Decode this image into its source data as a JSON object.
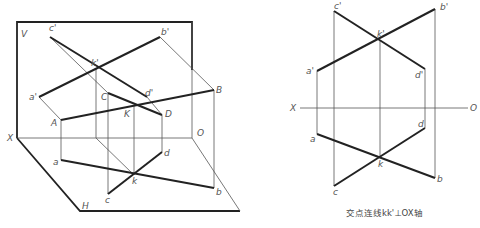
{
  "left_diagram": {
    "plane_labels": {
      "v": "V",
      "h": "H",
      "x": "X",
      "o": "O"
    },
    "points_upper": {
      "A": "A",
      "B": "B",
      "C": "C",
      "D": "D",
      "K": "K"
    },
    "points_v": {
      "a": "a'",
      "b": "b'",
      "c": "c'",
      "d": "d'",
      "k": "k'"
    },
    "points_h": {
      "a": "a",
      "b": "b",
      "c": "c",
      "d": "d",
      "k": "k"
    }
  },
  "right_diagram": {
    "axis": {
      "x": "X",
      "o": "O"
    },
    "points_v": {
      "a": "a'",
      "b": "b'",
      "c": "c'",
      "d": "d'",
      "k": "k'"
    },
    "points_h": {
      "a": "a",
      "b": "b",
      "c": "c",
      "d": "d",
      "k": "k"
    },
    "caption": "交点连线kk'⊥OX轴"
  }
}
